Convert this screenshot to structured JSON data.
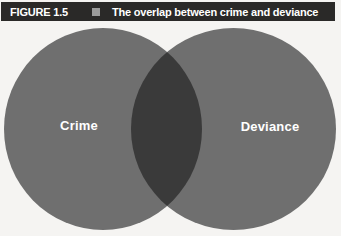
{
  "figure": {
    "label": "FIGURE 1.5",
    "title": "The overlap between crime and deviance"
  },
  "venn": {
    "left_label": "Crime",
    "right_label": "Deviance",
    "overlap_meaning": "acts that are both crime and deviance"
  },
  "colors": {
    "background": "#f5f4f2",
    "header_bg": "#2a2928",
    "header_text": "#ffffff",
    "marker_square": "#9b9b9b",
    "circle_fill": "#6f6f6f",
    "overlap_fill": "#3a3a3a",
    "label_text": "#ffffff"
  }
}
